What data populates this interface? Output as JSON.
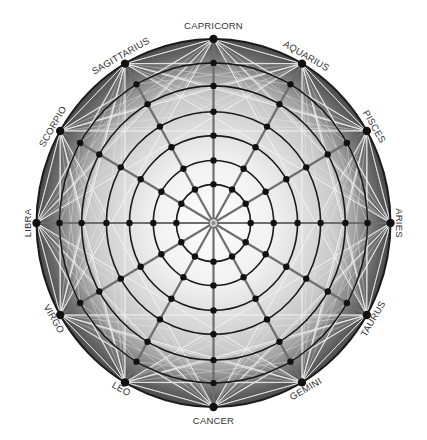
{
  "diagram": {
    "signs": [
      {
        "name": "ARIES",
        "angle_deg": 0
      },
      {
        "name": "PISCES",
        "angle_deg": 30
      },
      {
        "name": "AQUARIUS",
        "angle_deg": 60
      },
      {
        "name": "CAPRICORN",
        "angle_deg": 90
      },
      {
        "name": "SAGITTARIUS",
        "angle_deg": 120
      },
      {
        "name": "SCORPIO",
        "angle_deg": 150
      },
      {
        "name": "LIBRA",
        "angle_deg": 180
      },
      {
        "name": "VIRGO",
        "angle_deg": 210
      },
      {
        "name": "LEO",
        "angle_deg": 240
      },
      {
        "name": "CANCER",
        "angle_deg": 270
      },
      {
        "name": "GEMINI",
        "angle_deg": 300
      },
      {
        "name": "TAURUS",
        "angle_deg": 330
      }
    ],
    "ring_count": 7,
    "spoke_count": 12,
    "colors": {
      "center": "#ffffff",
      "mid": "#c9c9c9",
      "edge": "#4a4a4a",
      "ring_stroke": "#1a1a1a",
      "spoke_stroke": "#6e6e6e",
      "chord_stroke": "#f2f2f2",
      "node_fill": "#111111",
      "label_text": "#333333"
    }
  }
}
